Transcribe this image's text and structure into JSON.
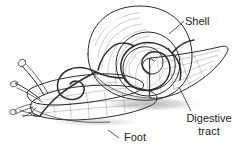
{
  "figure": {
    "style": "grayscale pen-and-ink line drawing",
    "background_color": "#ffffff",
    "ink_color": "#2b2b2b",
    "shell_fill_light": "#f4f4f4",
    "shell_fill_mid": "#d9d9d9",
    "shell_fill_dark": "#bdbdbd",
    "body_fill": "#ededed",
    "shadow_color": "#b9b9b9"
  },
  "labels": {
    "shell": {
      "text": "Shell",
      "x": 185,
      "y": 25
    },
    "digestive_tract": {
      "line1": "Digestive",
      "line2": "tract",
      "x": 209,
      "y": 122
    },
    "foot": {
      "text": "Foot",
      "x": 124,
      "y": 141
    }
  },
  "parts": [
    {
      "name": "shell",
      "description": "large coiled spiral shell"
    },
    {
      "name": "digestive-tract",
      "description": "dark looping tube coiling inside shell and into head"
    },
    {
      "name": "foot",
      "description": "elongated muscular base of the body"
    },
    {
      "name": "tentacles",
      "description": "two pairs of tentacles on the head"
    },
    {
      "name": "tail",
      "description": "pointed tail extending to the right"
    },
    {
      "name": "shadow",
      "description": "cast shadow beneath the snail"
    }
  ]
}
